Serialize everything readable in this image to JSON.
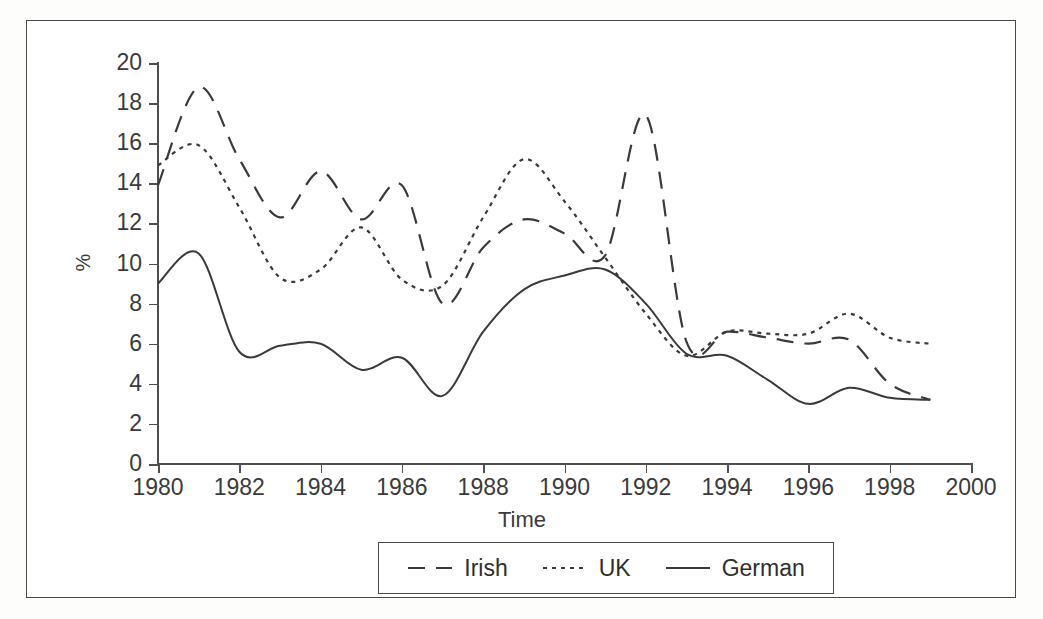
{
  "figure": {
    "axis_title_x": "Time",
    "axis_title_y": "%"
  },
  "legend": {
    "entries": [
      {
        "label": "Irish",
        "style": "long-dash",
        "color": "#3a3a3a"
      },
      {
        "label": "UK",
        "style": "dotted",
        "color": "#3a3a3a"
      },
      {
        "label": "German",
        "style": "solid",
        "color": "#3a3a3a"
      }
    ]
  },
  "chart_data": {
    "type": "line",
    "title": "",
    "subtitle": "",
    "xlabel": "Time",
    "ylabel": "%",
    "xlim": [
      1980,
      2000
    ],
    "ylim": [
      0,
      20
    ],
    "xticks": [
      1980,
      1982,
      1984,
      1986,
      1988,
      1990,
      1992,
      1994,
      1996,
      1998,
      2000
    ],
    "yticks": [
      0,
      2,
      4,
      6,
      8,
      10,
      12,
      14,
      16,
      18,
      20
    ],
    "xtick_labels": [
      "1980",
      "1982",
      "1984",
      "1986",
      "1988",
      "1990",
      "1992",
      "1994",
      "1996",
      "1998",
      "2000"
    ],
    "ytick_labels": [
      "0",
      "2",
      "4",
      "6",
      "8",
      "10",
      "12",
      "14",
      "16",
      "18",
      "20"
    ],
    "grid": false,
    "legend_position": "below-axes",
    "x": [
      1980,
      1981,
      1982,
      1983,
      1984,
      1985,
      1986,
      1987,
      1988,
      1989,
      1990,
      1991,
      1992,
      1993,
      1994,
      1995,
      1996,
      1997,
      1998,
      1999
    ],
    "series": [
      {
        "name": "Irish",
        "style": "long-dash",
        "color": "#3a3a3a",
        "values": [
          13.9,
          18.8,
          15.2,
          12.3,
          14.6,
          12.2,
          13.9,
          8.0,
          10.8,
          12.2,
          11.5,
          10.4,
          17.4,
          6.1,
          6.6,
          6.3,
          6.0,
          6.2,
          4.0,
          3.2
        ]
      },
      {
        "name": "UK",
        "style": "dotted",
        "color": "#3a3a3a",
        "values": [
          14.9,
          15.9,
          12.8,
          9.3,
          9.7,
          11.8,
          9.2,
          8.9,
          12.3,
          15.2,
          13.1,
          10.3,
          7.5,
          5.4,
          6.6,
          6.5,
          6.5,
          7.5,
          6.3,
          6.0
        ]
      },
      {
        "name": "German",
        "style": "solid",
        "color": "#3a3a3a",
        "values": [
          9.0,
          10.5,
          5.6,
          5.9,
          6.0,
          4.7,
          5.3,
          3.4,
          6.6,
          8.7,
          9.4,
          9.7,
          8.0,
          5.5,
          5.4,
          4.2,
          3.0,
          3.8,
          3.3,
          3.2
        ]
      }
    ]
  }
}
